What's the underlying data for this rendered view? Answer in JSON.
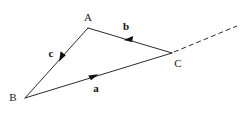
{
  "figure": {
    "width": 242,
    "height": 113,
    "background_color": "#ffffff",
    "stroke_color": "#2b2b2b",
    "label_color": "#111111"
  },
  "vertices": [
    {
      "id": "A",
      "label": "A",
      "x": 88,
      "y": 28,
      "label_x": 88,
      "label_y": 21
    },
    {
      "id": "B",
      "label": "B",
      "x": 25,
      "y": 98,
      "label_x": 13,
      "label_y": 101
    },
    {
      "id": "C",
      "label": "C",
      "x": 172,
      "y": 53,
      "label_x": 178,
      "label_y": 67
    }
  ],
  "vectors": [
    {
      "id": "a",
      "label": "a",
      "from": "B",
      "to": "C",
      "arrow_x": 94,
      "arrow_y": 76,
      "label_x": 96,
      "label_y": 92
    },
    {
      "id": "b",
      "label": "b",
      "from": "C",
      "to": "A",
      "arrow_x": 129,
      "arrow_y": 40,
      "label_x": 126,
      "label_y": 30
    },
    {
      "id": "c",
      "label": "c",
      "from": "A",
      "to": "B",
      "arrow_x": 62,
      "arrow_y": 57,
      "label_x": 51,
      "label_y": 57
    }
  ],
  "ray": {
    "id": "extension-ray",
    "style": "dashed",
    "from_x": 174,
    "from_y": 52,
    "to_x": 237,
    "to_y": 26
  }
}
